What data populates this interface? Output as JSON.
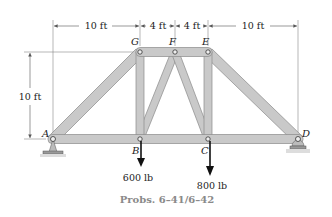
{
  "figure": {
    "caption": "Probs. 6–41/6–42",
    "type": "truss-diagram",
    "colors": {
      "member_fill": "#c9c9c9",
      "member_stroke": "#8a8a8a",
      "dimension_line": "#555555",
      "load_arrow": "#111111",
      "caption": "#8a8a8a"
    }
  },
  "dimensions": {
    "top": [
      {
        "label": "10 ft",
        "from": "A",
        "to": "G"
      },
      {
        "label": "4 ft",
        "from": "G",
        "to": "F"
      },
      {
        "label": "4 ft",
        "from": "F",
        "to": "E"
      },
      {
        "label": "10 ft",
        "from": "E",
        "to": "D"
      }
    ],
    "height": {
      "label": "10 ft"
    }
  },
  "joints": {
    "A": {
      "label": "A"
    },
    "B": {
      "label": "B"
    },
    "C": {
      "label": "C"
    },
    "D": {
      "label": "D"
    },
    "E": {
      "label": "E"
    },
    "F": {
      "label": "F"
    },
    "G": {
      "label": "G"
    }
  },
  "members": [
    "AB",
    "BC",
    "CD",
    "AG",
    "GF",
    "FE",
    "ED",
    "GB",
    "BF",
    "FC",
    "EC"
  ],
  "supports": {
    "A": "pin",
    "D": "rocker"
  },
  "loads": [
    {
      "joint": "B",
      "label": "600 lb",
      "direction": "down"
    },
    {
      "joint": "C",
      "label": "800 lb",
      "direction": "down"
    }
  ]
}
